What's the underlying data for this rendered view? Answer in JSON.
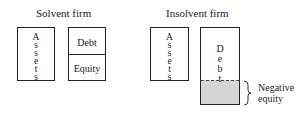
{
  "solvent": {
    "title": "Solvent firm",
    "assets_letters": [
      "A",
      "s",
      "s",
      "e",
      "t",
      "s"
    ],
    "debt_label": "Debt",
    "equity_label": "Equity"
  },
  "insolvent": {
    "title": "Insolvent firm",
    "assets_letters": [
      "A",
      "s",
      "s",
      "e",
      "t",
      "s"
    ],
    "debt_letters": [
      "D",
      "e",
      "b",
      "t"
    ],
    "negative_equity_label_line1": "Negative",
    "negative_equity_label_line2": "equity"
  },
  "colors": {
    "stroke": "#222222",
    "negative_equity_fill": "#d6d6d6",
    "background": "#ffffff"
  }
}
